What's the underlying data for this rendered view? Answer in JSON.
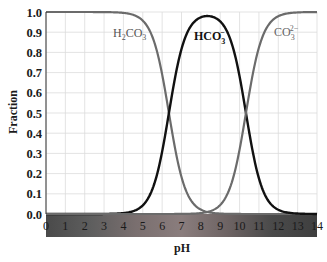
{
  "chart_data": {
    "type": "line",
    "title": "",
    "xlabel": "pH",
    "ylabel": "Fraction",
    "xlim": [
      0,
      14
    ],
    "ylim": [
      0.0,
      1.0
    ],
    "x_ticks": [
      "0",
      "1",
      "2",
      "3",
      "4",
      "5",
      "6",
      "7",
      "8",
      "9",
      "10",
      "11",
      "12",
      "13",
      "14"
    ],
    "y_ticks": [
      "0.0",
      "0.1",
      "0.2",
      "0.3",
      "0.4",
      "0.5",
      "0.6",
      "0.7",
      "0.8",
      "0.9",
      "1.0"
    ],
    "grid": true,
    "legend": "inline labels",
    "pKa1": 6.35,
    "pKa2": 10.33,
    "x": [
      0,
      1,
      2,
      3,
      4,
      5,
      6,
      7,
      8,
      9,
      10,
      11,
      12,
      13,
      14
    ],
    "series": [
      {
        "name": "H2CO3",
        "label_main": "H",
        "label_parts": [
          "H",
          "2",
          "CO",
          "3"
        ],
        "color": "#6b6b6b",
        "values": [
          1.0,
          1.0,
          1.0,
          1.0,
          0.996,
          0.957,
          0.691,
          0.183,
          0.022,
          0.002,
          0.0,
          0.0,
          0.0,
          0.0,
          0.0
        ]
      },
      {
        "name": "HCO3-",
        "color": "#111111",
        "values": [
          0.0,
          0.0,
          0.0,
          0.0,
          0.004,
          0.043,
          0.309,
          0.817,
          0.974,
          0.953,
          0.681,
          0.176,
          0.021,
          0.002,
          0.0
        ]
      },
      {
        "name": "CO3 2-",
        "color": "#6b6b6b",
        "values": [
          0.0,
          0.0,
          0.0,
          0.0,
          0.0,
          0.0,
          0.0,
          0.0,
          0.005,
          0.045,
          0.319,
          0.824,
          0.979,
          0.998,
          1.0
        ]
      }
    ],
    "annotations": {
      "h2co3": {
        "base": "H",
        "sub1": "2",
        "mid": "CO",
        "sub2": "3"
      },
      "hco3": {
        "base": "HCO",
        "sub": "3",
        "sup": "−"
      },
      "co3": {
        "base": "CO",
        "sub": "3",
        "sup": "2−"
      }
    },
    "ph_bar": {
      "description": "pH color strip beneath x-axis",
      "colors": [
        "#4a4a4a",
        "#5e5e5e",
        "#7a6f6f",
        "#8a7d7d",
        "#6e6464",
        "#4a4a4a",
        "#3f3f3f"
      ]
    }
  }
}
